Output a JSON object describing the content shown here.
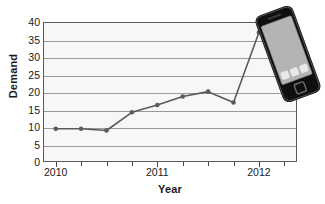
{
  "chart_data": {
    "type": "line",
    "title": "",
    "xlabel": "Year",
    "ylabel": "Demand",
    "ylim": [
      0,
      40
    ],
    "ytick_values": [
      0,
      5,
      10,
      15,
      20,
      25,
      30,
      35,
      40
    ],
    "ytick_labels": [
      "0",
      "5",
      "10",
      "15",
      "20",
      "25",
      "30",
      "35",
      "40"
    ],
    "xlim": [
      2009.875,
      2012.375
    ],
    "xtick_values": [
      2010,
      2011,
      2012
    ],
    "xtick_labels": [
      "2010",
      "2011",
      "2012"
    ],
    "xminor_values": [
      2010.25,
      2010.5,
      2010.75,
      2011.25,
      2011.5,
      2011.75,
      2012.25
    ],
    "grid": "horizontal",
    "legend": "none",
    "series": [
      {
        "name": "Demand",
        "color": "#5a5a5a",
        "marker": "circle",
        "x": [
          2010.0,
          2010.25,
          2010.5,
          2010.75,
          2011.0,
          2011.25,
          2011.5,
          2011.75,
          2012.0
        ],
        "values": [
          9.5,
          9.5,
          9.0,
          14.2,
          16.3,
          18.7,
          20.1,
          17.0,
          37.0
        ]
      }
    ]
  },
  "decoration": {
    "phone": {
      "name": "smartphone-illustration",
      "body_color": "#1c1c1c",
      "screen_color": "#b4b4b4",
      "app_icon_color": "#e8e8e8",
      "rotation_deg": -20
    }
  }
}
